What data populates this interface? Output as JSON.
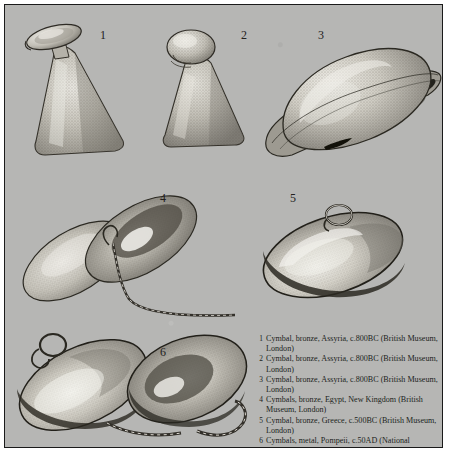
{
  "plate": {
    "background_color": "#b6b6b4",
    "border_color": "#1a1a1a",
    "ink_color": "#201f1c"
  },
  "figure_numbers": [
    {
      "label": "1",
      "x": 95,
      "y": 24
    },
    {
      "label": "2",
      "x": 236,
      "y": 24
    },
    {
      "label": "3",
      "x": 313,
      "y": 24
    },
    {
      "label": "4",
      "x": 155,
      "y": 187
    },
    {
      "label": "5",
      "x": 285,
      "y": 187
    },
    {
      "label": "6",
      "x": 155,
      "y": 341
    }
  ],
  "figures": [
    {
      "id": "figure-1",
      "name": "cymbal-conical-bell-1"
    },
    {
      "id": "figure-2",
      "name": "cymbal-conical-bell-2"
    },
    {
      "id": "figure-3",
      "name": "cymbal-domed-large-3"
    },
    {
      "id": "figure-4",
      "name": "cymbal-pair-chained-4"
    },
    {
      "id": "figure-5",
      "name": "cymbal-flat-disc-ring-5"
    },
    {
      "id": "figure-6",
      "name": "cymbal-pair-chained-6"
    }
  ],
  "caption": {
    "entries": [
      {
        "index": "1",
        "text": "Cymbal, bronze, Assyria, c.800BC (British Museum, London)"
      },
      {
        "index": "2",
        "text": "Cymbal, bronze, Assyria, c.800BC (British Museum, London)"
      },
      {
        "index": "3",
        "text": "Cymbal, bronze, Assyria, c.800BC (British Museum, London)"
      },
      {
        "index": "4",
        "text": "Cymbals, bronze, Egypt, New Kingdom (British Museum, London)"
      },
      {
        "index": "5",
        "text": "Cymbal, bronze, Greece, c.500BC (British Museum, London)"
      },
      {
        "index": "6",
        "text": "Cymbals, metal, Pompeii, c.50AD (National Museum, Naples)"
      }
    ]
  }
}
